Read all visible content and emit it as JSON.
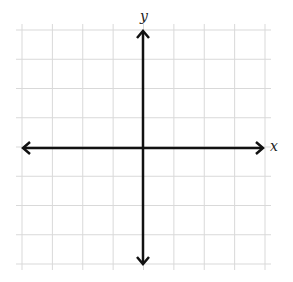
{
  "diagram": {
    "type": "coordinate-plane",
    "x_axis_label": "x",
    "y_axis_label": "y",
    "grid": {
      "columns": 8,
      "rows": 8,
      "line_color": "#d9d9d9"
    },
    "axis_color": "#111111",
    "arrows": [
      "left",
      "right",
      "up",
      "down"
    ]
  }
}
